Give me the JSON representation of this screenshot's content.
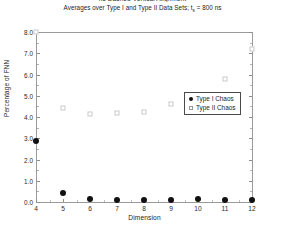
{
  "figure": {
    "clipped_top_title": "ns Dashed Vertical Alignment",
    "title_prefix": "Averages over Type I and Type II Data Sets; t",
    "title_subscript": "s",
    "title_suffix": " = 800 ns"
  },
  "chart_data": {
    "type": "scatter",
    "xlabel": "Dimension",
    "ylabel": "Percentage of FNN",
    "xlim": [
      4,
      12
    ],
    "ylim": [
      0.0,
      8.0
    ],
    "grid": false,
    "legend_position": "upper-center",
    "x": [
      4,
      5,
      6,
      7,
      8,
      9,
      10,
      11,
      12
    ],
    "xtick_labels": [
      "4",
      "5",
      "6",
      "7",
      "8",
      "9",
      "10",
      "11",
      "12"
    ],
    "ytick_labels": [
      "0.0",
      "1.0",
      "2.0",
      "3.0",
      "4.0",
      "5.0",
      "6.0",
      "7.0",
      "8.0"
    ],
    "ytick_values": [
      0.0,
      1.0,
      2.0,
      3.0,
      4.0,
      5.0,
      6.0,
      7.0,
      8.0
    ],
    "series": [
      {
        "name": "Type I Chaos",
        "marker": "filled-circle",
        "color": "#111111",
        "values": [
          2.85,
          0.42,
          0.12,
          0.11,
          0.1,
          0.1,
          0.12,
          0.1,
          0.1
        ]
      },
      {
        "name": "Type II Chaos",
        "marker": "open-square",
        "color": "#c9c9c9",
        "values": [
          8.0,
          4.42,
          4.12,
          4.2,
          4.25,
          4.6,
          5.0,
          5.8,
          7.2
        ]
      }
    ]
  },
  "legend": {
    "entries": [
      {
        "label": "Type I Chaos",
        "marker": "filled-circle"
      },
      {
        "label": "Type II Chaos",
        "marker": "open-square"
      }
    ]
  }
}
